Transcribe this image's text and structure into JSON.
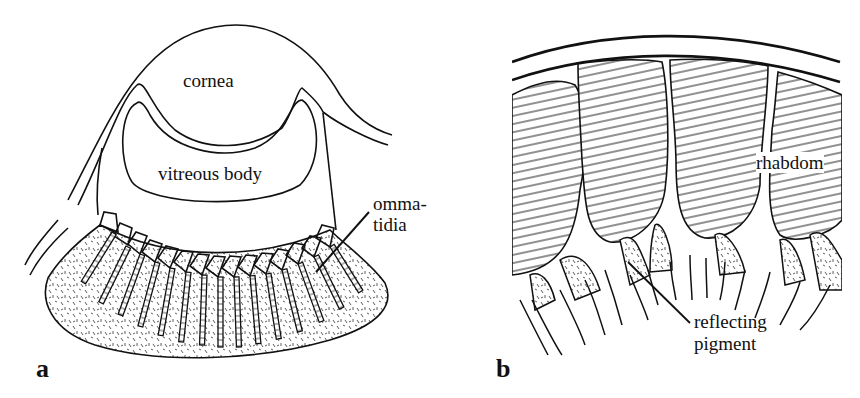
{
  "figure": {
    "panel_a": {
      "letter": "a",
      "labels": {
        "cornea": "cornea",
        "vitreous_body": "vitreous body",
        "ommatidia_line1": "omma-",
        "ommatidia_line2": "tidia"
      }
    },
    "panel_b": {
      "letter": "b",
      "labels": {
        "rhabdom": "rhabdom",
        "reflecting_line1": "reflecting",
        "reflecting_line2": "pigment"
      }
    },
    "colors": {
      "ink": "#111111",
      "background": "#ffffff"
    }
  }
}
